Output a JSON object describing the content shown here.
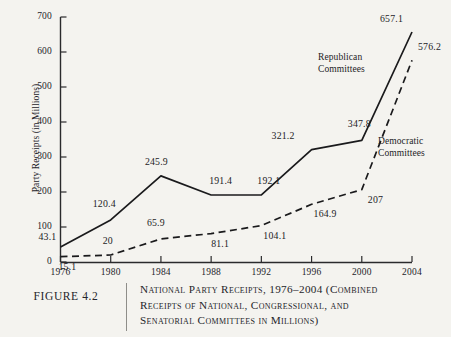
{
  "figure": {
    "number_label": "FIGURE 4.2",
    "caption_lines": [
      "National Party Receipts, 1976–2004 (Combined",
      "Receipts of National, Congressional, and",
      "Senatorial Committees in Millions)"
    ]
  },
  "chart_data": {
    "type": "line",
    "xlabel": "",
    "ylabel": "Party Receipts (in Millions)",
    "categories": [
      "1976",
      "1980",
      "1984",
      "1988",
      "1992",
      "1996",
      "2000",
      "2004"
    ],
    "x": [
      1976,
      1980,
      1984,
      1988,
      1992,
      1996,
      2000,
      2004
    ],
    "xlim": [
      1976,
      2004
    ],
    "ylim": [
      0,
      700
    ],
    "yticks": [
      0,
      100,
      200,
      300,
      400,
      500,
      600,
      700
    ],
    "ytick_labels": [
      "0",
      "100",
      "200",
      "300",
      "400",
      "500",
      "600",
      "700"
    ],
    "grid": false,
    "legend_position": "inline-annotations",
    "series": [
      {
        "name": "Republican Committees",
        "style": "solid",
        "color": "#1a1a1c",
        "values": [
          43.1,
          120.4,
          245.9,
          191.4,
          192.1,
          321.2,
          347.8,
          657.1
        ],
        "value_labels": [
          "43.1",
          "120.4",
          "245.9",
          "191.4",
          "192.1",
          "321.2",
          "347.8",
          "657.1"
        ]
      },
      {
        "name": "Democratic Committees",
        "style": "dashed",
        "color": "#1a1a1c",
        "values": [
          15.1,
          20,
          65.9,
          81.1,
          104.1,
          164.9,
          207,
          576.2
        ],
        "value_labels": [
          "15.1",
          "20",
          "65.9",
          "81.1",
          "104.1",
          "164.9",
          "207",
          "576.2"
        ]
      }
    ],
    "annotations": [
      {
        "text_lines": [
          "Republican",
          "Committees"
        ],
        "series": "Republican Committees"
      },
      {
        "text_lines": [
          "Democratic",
          "Committees"
        ],
        "series": "Democratic Committees"
      }
    ]
  }
}
